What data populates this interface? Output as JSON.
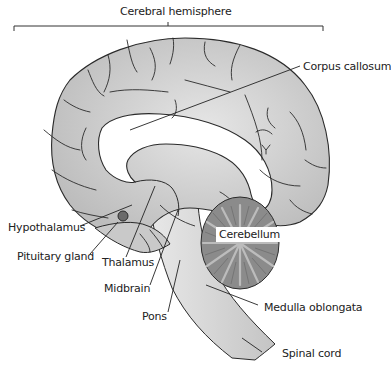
{
  "diagram": {
    "title": "Cerebral hemisphere",
    "colors": {
      "cortex_fill": "#c8c8c8",
      "cortex_outline": "#2a2a2a",
      "white_matter": "#ffffff",
      "brainstem_fill": "#d0d0d0",
      "cerebellum_fill": "#8a8a8a",
      "cerebellum_folia": "#b8b8b8",
      "label_text": "#222222",
      "leader_lines": "#222222"
    },
    "labels": {
      "cerebral_hemisphere": "Cerebral hemisphere",
      "corpus_callosum": "Corpus callosum",
      "hypothalamus": "Hypothalamus",
      "pituitary_gland": "Pituitary gland",
      "thalamus": "Thalamus",
      "midbrain": "Midbrain",
      "pons": "Pons",
      "cerebellum": "Cerebellum",
      "medulla_oblongata": "Medulla oblongata",
      "spinal_cord": "Spinal cord"
    }
  }
}
